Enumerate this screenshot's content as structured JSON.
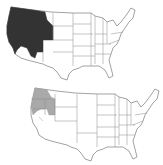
{
  "maps": [
    {
      "name": "top-map",
      "highlight_color": "#333333",
      "highlighted_states": [
        "WA",
        "OR",
        "ID",
        "MT",
        "WY",
        "NV",
        "UT",
        "CO",
        "CA"
      ]
    },
    {
      "name": "bottom-map",
      "highlight_color": "#a9a9a9",
      "highlighted_states": [
        "WA",
        "OR",
        "ID",
        "NV",
        "CA"
      ]
    }
  ],
  "colors": {
    "background": "#ffffff",
    "state_border": "#8a8a8a",
    "state_fill": "#ffffff"
  }
}
